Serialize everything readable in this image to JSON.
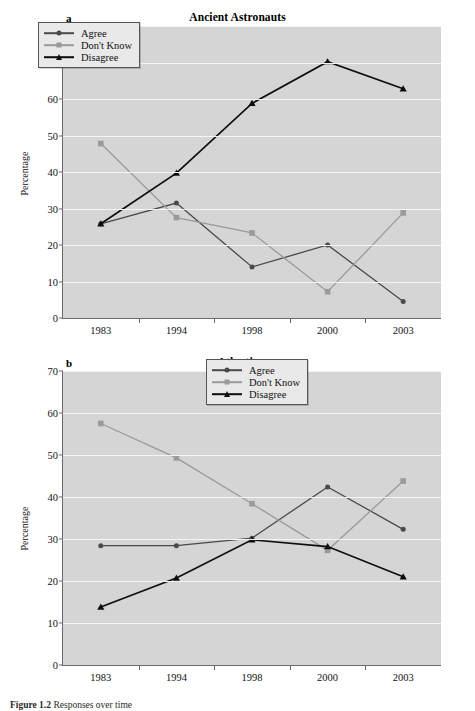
{
  "figure": {
    "caption_label": "Figure 1.2",
    "caption_text": "Responses over time"
  },
  "colors": {
    "agree": "#4a4a4a",
    "dont_know": "#9a9a9a",
    "disagree": "#0d0d0d",
    "plot_background": "#d5d5d5",
    "gridline": "#f4f4f4",
    "axis": "#6a6a6a"
  },
  "panels": [
    {
      "letter": "a",
      "title": "Ancient Astronauts",
      "ylabel": "Percentage",
      "legend_position": "top-left",
      "chart_data": {
        "type": "line",
        "title": "Ancient Astronauts",
        "xlabel": "",
        "ylabel": "Percentage",
        "categories": [
          "1983",
          "1994",
          "1998",
          "2000",
          "2003"
        ],
        "x": [
          1983,
          1994,
          1998,
          2000,
          2003
        ],
        "ylim": [
          0,
          80
        ],
        "yticks": [
          0,
          10,
          20,
          30,
          40,
          50,
          60,
          70,
          80
        ],
        "grid": true,
        "legend": [
          "Agree",
          "Don't Know",
          "Disagree"
        ],
        "series": [
          {
            "name": "Agree",
            "marker": "circle",
            "color": "#4a4a4a",
            "values": [
              25.8,
              31.5,
              14.0,
              20.0,
              4.5
            ]
          },
          {
            "name": "Don't Know",
            "marker": "square",
            "color": "#9a9a9a",
            "values": [
              47.8,
              27.5,
              23.3,
              7.2,
              28.8
            ]
          },
          {
            "name": "Disagree",
            "marker": "triangle",
            "color": "#0d0d0d",
            "values": [
              25.8,
              39.7,
              58.8,
              70.2,
              62.8
            ]
          }
        ]
      }
    },
    {
      "letter": "b",
      "title": "Atlantis",
      "ylabel": "Percentage",
      "legend_position": "top-right",
      "chart_data": {
        "type": "line",
        "title": "Atlantis",
        "xlabel": "",
        "ylabel": "Percentage",
        "categories": [
          "1983",
          "1994",
          "1998",
          "2000",
          "2003"
        ],
        "x": [
          1983,
          1994,
          1998,
          2000,
          2003
        ],
        "ylim": [
          0,
          70
        ],
        "yticks": [
          0,
          10,
          20,
          30,
          40,
          50,
          60,
          70
        ],
        "grid": true,
        "legend": [
          "Agree",
          "Don't Know",
          "Disagree"
        ],
        "series": [
          {
            "name": "Agree",
            "marker": "circle",
            "color": "#4a4a4a",
            "values": [
              28.4,
              28.4,
              30.2,
              42.4,
              32.3
            ]
          },
          {
            "name": "Don't Know",
            "marker": "square",
            "color": "#9a9a9a",
            "values": [
              57.5,
              49.3,
              38.4,
              27.3,
              43.8
            ]
          },
          {
            "name": "Disagree",
            "marker": "triangle",
            "color": "#0d0d0d",
            "values": [
              13.8,
              20.7,
              29.8,
              28.2,
              21.0
            ]
          }
        ]
      }
    }
  ]
}
